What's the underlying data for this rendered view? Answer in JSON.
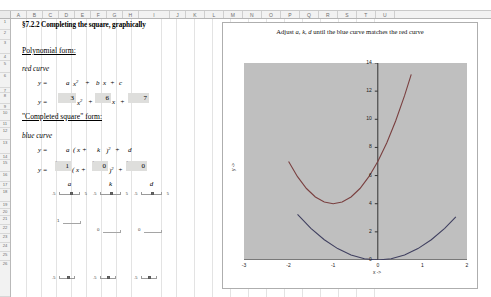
{
  "app": {
    "columns": [
      "A",
      "B",
      "C",
      "D",
      "E",
      "F",
      "G",
      "H",
      "I",
      "J",
      "K",
      "L",
      "M",
      "N",
      "O",
      "P",
      "Q",
      "R",
      "S",
      "T",
      "U"
    ],
    "rows": [
      "1",
      "2",
      "3",
      "4",
      "5",
      "6",
      "7",
      "8",
      "9",
      "10",
      "11",
      "12",
      "13",
      "14",
      "15",
      "16",
      "17",
      "18",
      "19",
      "20",
      "21",
      "22",
      "23",
      "24",
      "25",
      "26"
    ]
  },
  "sheet": {
    "title": "§7.2.2  Completing the square, graphically",
    "polynomial_heading": "Polynomial form:",
    "red_curve_label": "red curve",
    "poly_generic": {
      "lhs": "y =",
      "a": "a",
      "x2": "x",
      "exp": "2",
      "plus1": "+",
      "b": "b",
      "x": "x",
      "plus2": "+",
      "c": "c"
    },
    "poly_values": {
      "lhs": "y =",
      "a": "3",
      "x2": "x",
      "exp": "2",
      "plus1": "+",
      "b": "6",
      "x": "x",
      "plus2": "+",
      "c": "7"
    },
    "completed_heading": "\"Completed square\" form:",
    "blue_curve_label": "blue curve",
    "cs_generic": {
      "lhs": "y =",
      "a": "a",
      "open": "( x +",
      "k": "k",
      "close": ")",
      "exp": "2",
      "plus": "+",
      "d": "d"
    },
    "cs_values": {
      "lhs": "y =",
      "a": "1",
      "open": "( x +",
      "k": "0",
      "close": ")",
      "exp": "2",
      "plus": "+",
      "d": "0"
    }
  },
  "sliders": [
    {
      "name": "a",
      "label": "a",
      "min": "-5",
      "max": "5",
      "value": "1",
      "thumb_pct": 52
    },
    {
      "name": "k",
      "label": "k",
      "min": "-5",
      "max": "5",
      "value": "0",
      "thumb_pct": 50
    },
    {
      "name": "d",
      "label": "d",
      "min": "-5",
      "max": "5",
      "value": "0",
      "thumb_pct": 50
    }
  ],
  "stub_sliders": [
    {
      "name": "a-readout",
      "value": "1",
      "left": 57,
      "top": 219
    },
    {
      "name": "k-readout",
      "value": "0",
      "left": 98,
      "top": 227
    },
    {
      "name": "d-readout",
      "value": "0",
      "left": 139,
      "top": 227
    }
  ],
  "chart_data": {
    "type": "line",
    "title": "Adjust  a, k, d  until the blue curve matches the red curve",
    "title_parts": {
      "pre": "Adjust",
      "vars": "a, k, d",
      "post": "until the blue curve matches the red curve"
    },
    "xlabel": "x ->",
    "ylabel": "y ->",
    "xlim": [
      -3,
      2
    ],
    "ylim": [
      0,
      14
    ],
    "xticks": [
      "-3",
      "-2",
      "-1",
      "0",
      "1",
      "2"
    ],
    "yticks": [
      "0",
      "2",
      "4",
      "6",
      "8",
      "10",
      "12",
      "14"
    ],
    "grid": false,
    "legend": "none",
    "plot_bg": "#bfbfbf",
    "series": [
      {
        "name": "red curve",
        "color": "#7a4040",
        "equation": "y = 3x^2 + 6x + 7",
        "coefficients": {
          "a": 3,
          "b": 6,
          "c": 7
        },
        "vertex": [
          -1,
          4
        ],
        "points_x": [
          -2.0,
          -1.8,
          -1.6,
          -1.4,
          -1.2,
          -1.0,
          -0.8,
          -0.6,
          -0.4,
          -0.2,
          0.0,
          0.2,
          0.4,
          0.6,
          0.75
        ],
        "points_y": [
          7.0,
          5.92,
          5.08,
          4.48,
          4.12,
          4.0,
          4.12,
          4.48,
          5.08,
          5.92,
          7.0,
          8.32,
          9.88,
          11.68,
          13.19
        ]
      },
      {
        "name": "blue curve",
        "color": "#404060",
        "equation": "y = 1(x + 0)^2 + 0",
        "coefficients": {
          "a": 1,
          "k": 0,
          "d": 0
        },
        "vertex": [
          0,
          0
        ],
        "points_x": [
          -1.8,
          -1.5,
          -1.2,
          -0.9,
          -0.6,
          -0.3,
          0.0,
          0.3,
          0.6,
          0.9,
          1.2,
          1.5,
          1.75
        ],
        "points_y": [
          3.24,
          2.25,
          1.44,
          0.81,
          0.36,
          0.09,
          0.0,
          0.09,
          0.36,
          0.81,
          1.44,
          2.25,
          3.06
        ]
      }
    ]
  }
}
